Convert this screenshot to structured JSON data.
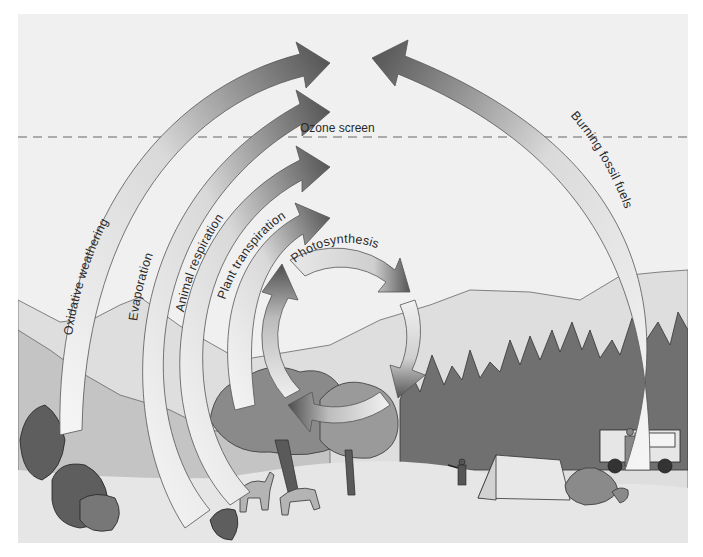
{
  "diagram": {
    "ozone_label": "Ozone screen",
    "processes": [
      {
        "id": "oxidative-weathering",
        "label": "Oxidative weathering",
        "direction": "to-atmosphere"
      },
      {
        "id": "evaporation",
        "label": "Evaporation",
        "direction": "to-atmosphere"
      },
      {
        "id": "animal-respiration",
        "label": "Animal respiration",
        "direction": "to-atmosphere"
      },
      {
        "id": "plant-transpiration",
        "label": "Plant transpiration",
        "direction": "to-atmosphere"
      },
      {
        "id": "photosynthesis",
        "label": "Photosynthesis",
        "direction": "cycle"
      },
      {
        "id": "burning-fossil-fuels",
        "label": "Burning fossil fuels",
        "direction": "to-atmosphere"
      }
    ],
    "scene_elements": [
      "mountains",
      "forest",
      "trees",
      "deer",
      "camper",
      "tent",
      "rocks",
      "jeep",
      "ranger"
    ],
    "colors": {
      "sky": "#f0f0f0",
      "far_mountain": "#d8d8d8",
      "mid_mountain": "#bdbdbd",
      "forest": "#6e6e6e",
      "ground": "#e6e6e6",
      "arrow_light": "#f4f4f4",
      "arrow_dark": "#555555",
      "outline": "#4a4a4a"
    }
  }
}
